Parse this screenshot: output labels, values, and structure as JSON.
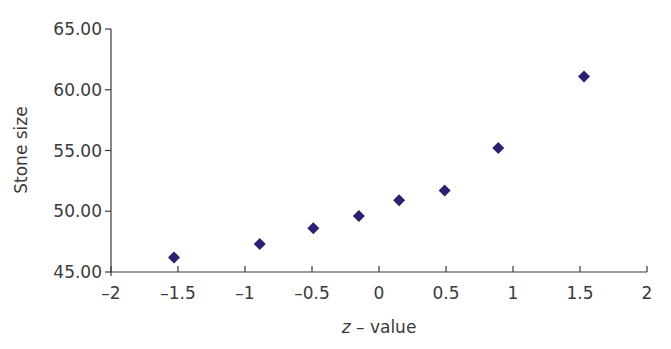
{
  "chart_data": {
    "type": "scatter",
    "title": "",
    "xlabel": "z – value",
    "xlabel_italic_part": "z",
    "xlabel_rest": " – value",
    "ylabel": "Stone size",
    "xlim": [
      -2,
      2
    ],
    "ylim": [
      45,
      65
    ],
    "x_ticks": [
      -2,
      -1.5,
      -1,
      -0.5,
      0,
      0.5,
      1,
      1.5,
      2
    ],
    "x_tick_labels": [
      "–2",
      "–1.5",
      "–1",
      "–0.5",
      "0",
      "0.5",
      "1",
      "1.5",
      "2"
    ],
    "y_ticks": [
      45,
      50,
      55,
      60,
      65
    ],
    "y_tick_labels": [
      "45.00",
      "50.00",
      "55.00",
      "60.00",
      "65.00"
    ],
    "grid": false,
    "legend": null,
    "marker": "diamond",
    "marker_color": "#2B2170",
    "series": [
      {
        "name": "Stone size vs z-value",
        "x": [
          -1.53,
          -0.89,
          -0.49,
          -0.15,
          0.15,
          0.49,
          0.89,
          1.53
        ],
        "y": [
          46.2,
          47.3,
          48.6,
          49.6,
          50.9,
          51.7,
          55.2,
          61.1
        ]
      }
    ]
  }
}
